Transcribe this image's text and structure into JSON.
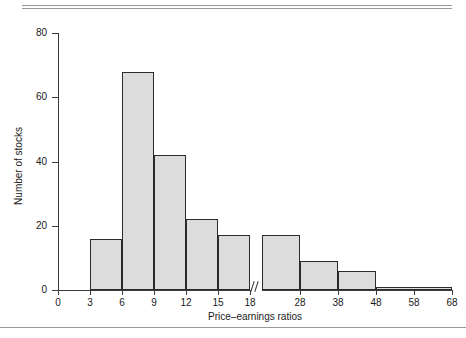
{
  "chart_data": {
    "type": "bar",
    "title": "",
    "subtitle": "",
    "xlabel": "Price–earnings ratios",
    "ylabel": "Number of stocks",
    "grid": false,
    "legend": false,
    "axis_break": {
      "present": true,
      "between": [
        18,
        18
      ],
      "note": "scale break on x-axis after 18; bins to the right are 10 units wide"
    },
    "xlim": [
      0,
      68
    ],
    "ylim": [
      0,
      80
    ],
    "xticks": [
      {
        "label": "0",
        "value": 0
      },
      {
        "label": "3",
        "value": 3
      },
      {
        "label": "6",
        "value": 6
      },
      {
        "label": "9",
        "value": 9
      },
      {
        "label": "12",
        "value": 12
      },
      {
        "label": "15",
        "value": 15
      },
      {
        "label": "18",
        "value": 18
      },
      {
        "label": "28",
        "value": 28
      },
      {
        "label": "38",
        "value": 38
      },
      {
        "label": "48",
        "value": 48
      },
      {
        "label": "58",
        "value": 58
      },
      {
        "label": "68",
        "value": 68
      }
    ],
    "yticks": [
      {
        "label": "0",
        "value": 0
      },
      {
        "label": "20",
        "value": 20
      },
      {
        "label": "40",
        "value": 40
      },
      {
        "label": "60",
        "value": 60
      },
      {
        "label": "80",
        "value": 80
      }
    ],
    "bin_edges_left": [
      3,
      6,
      9,
      12,
      15,
      18
    ],
    "bin_edges_right": [
      18,
      28,
      38,
      48,
      68
    ],
    "bars": [
      {
        "bin": "3–6",
        "x0": 3,
        "x1": 6,
        "value": 16,
        "segment": "left"
      },
      {
        "bin": "6–9",
        "x0": 6,
        "x1": 9,
        "value": 68,
        "segment": "left"
      },
      {
        "bin": "9–12",
        "x0": 9,
        "x1": 12,
        "value": 42,
        "segment": "left"
      },
      {
        "bin": "12–15",
        "x0": 12,
        "x1": 15,
        "value": 22,
        "segment": "left"
      },
      {
        "bin": "15–18",
        "x0": 15,
        "x1": 18,
        "value": 17,
        "segment": "left"
      },
      {
        "bin": "18–28",
        "x0": 18,
        "x1": 28,
        "value": 17,
        "segment": "right"
      },
      {
        "bin": "28–38",
        "x0": 28,
        "x1": 38,
        "value": 9,
        "segment": "right"
      },
      {
        "bin": "38–48",
        "x0": 38,
        "x1": 48,
        "value": 6,
        "segment": "right"
      },
      {
        "bin": "48–68",
        "x0": 48,
        "x1": 68,
        "value": 1,
        "segment": "right"
      }
    ],
    "categories": [
      "3–6",
      "6–9",
      "9–12",
      "12–15",
      "15–18",
      "18–28",
      "28–38",
      "38–48",
      "48–68"
    ],
    "values": [
      16,
      68,
      42,
      22,
      17,
      17,
      9,
      6,
      1
    ],
    "colors": {
      "bar_fill": "#dcdcdc",
      "bar_edge": "#2b2b2b",
      "axis": "#3a3a3a",
      "text": "#1a1a1a",
      "rule": "#9a9a9a",
      "background": "#ffffff"
    }
  }
}
